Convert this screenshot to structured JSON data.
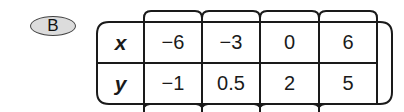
{
  "option": {
    "label": "B"
  },
  "table": {
    "headers": [
      "x",
      "y"
    ],
    "columns": [
      {
        "x": "−6",
        "y": "−1"
      },
      {
        "x": "−3",
        "y": "0.5"
      },
      {
        "x": "0",
        "y": "2"
      },
      {
        "x": "6",
        "y": "5"
      }
    ]
  }
}
